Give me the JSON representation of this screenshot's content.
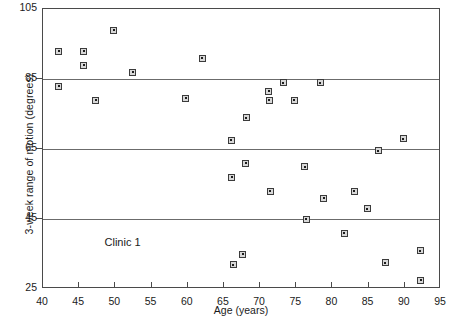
{
  "chart_data": {
    "type": "scatter",
    "title": "",
    "xlabel": "Age (years)",
    "ylabel": "3-week range of motion (degrees)",
    "xlim": [
      40,
      95
    ],
    "ylim": [
      25,
      105
    ],
    "xticks": [
      40,
      45,
      50,
      55,
      60,
      65,
      70,
      75,
      80,
      85,
      90,
      95
    ],
    "yticks": [
      25,
      45,
      65,
      85,
      105
    ],
    "grid": "horizontal gridlines at y = 45, 65, 85",
    "legend": "none",
    "annotations": [
      {
        "text": "Clinic 1",
        "x": 48.5,
        "y": 38
      }
    ],
    "series": [
      {
        "name": "Clinic 1 patients",
        "marker": "square-with-center-dot",
        "points": [
          {
            "x": 42.2,
            "y": 93
          },
          {
            "x": 42.2,
            "y": 83
          },
          {
            "x": 45.6,
            "y": 93
          },
          {
            "x": 45.6,
            "y": 89
          },
          {
            "x": 47.3,
            "y": 79
          },
          {
            "x": 49.8,
            "y": 99
          },
          {
            "x": 52.4,
            "y": 87
          },
          {
            "x": 59.7,
            "y": 79.5
          },
          {
            "x": 62.0,
            "y": 91
          },
          {
            "x": 66.0,
            "y": 67.5
          },
          {
            "x": 66.1,
            "y": 57
          },
          {
            "x": 66.3,
            "y": 32
          },
          {
            "x": 67.6,
            "y": 35
          },
          {
            "x": 68.0,
            "y": 61
          },
          {
            "x": 68.1,
            "y": 74
          },
          {
            "x": 71.2,
            "y": 81.5
          },
          {
            "x": 71.3,
            "y": 79
          },
          {
            "x": 71.4,
            "y": 53
          },
          {
            "x": 73.2,
            "y": 84
          },
          {
            "x": 74.7,
            "y": 79
          },
          {
            "x": 76.2,
            "y": 60
          },
          {
            "x": 76.4,
            "y": 45
          },
          {
            "x": 78.3,
            "y": 84
          },
          {
            "x": 78.8,
            "y": 51
          },
          {
            "x": 81.6,
            "y": 41
          },
          {
            "x": 83.0,
            "y": 53
          },
          {
            "x": 84.8,
            "y": 48
          },
          {
            "x": 86.3,
            "y": 64.5
          },
          {
            "x": 87.3,
            "y": 32.5
          },
          {
            "x": 89.8,
            "y": 68
          },
          {
            "x": 92.1,
            "y": 36
          },
          {
            "x": 92.2,
            "y": 27.5
          }
        ]
      }
    ],
    "colors": {
      "marker_edge": "#3b3b3b",
      "marker_face": "#d8d8d8",
      "axis": "#4a4a4a",
      "gridline": "#6b6b6b",
      "background": "#ffffff",
      "text": "#1a1a1a"
    }
  }
}
